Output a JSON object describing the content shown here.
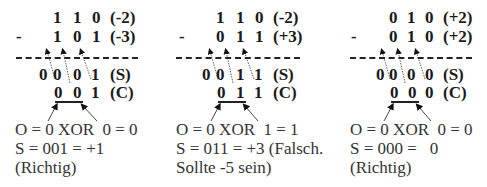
{
  "panels": [
    {
      "row1": {
        "digits": [
          "1",
          "1",
          "0"
        ],
        "label": "(-2)"
      },
      "row2": {
        "sign": "-",
        "digits": [
          "1",
          "0",
          "1"
        ],
        "label": "(-3)"
      },
      "sum": {
        "digits": [
          "0",
          "0",
          "0",
          "1"
        ],
        "label": "(S)"
      },
      "carry": {
        "digits": [
          "0",
          "0",
          "1"
        ],
        "label": "(C)"
      },
      "overflow_line": "O = 0 XOR  0 = 0",
      "result_line": "S = 001 = +1",
      "verdict_line": "(Richtig)"
    },
    {
      "row1": {
        "digits": [
          "1",
          "1",
          "0"
        ],
        "label": "(-2)"
      },
      "row2": {
        "sign": "-",
        "digits": [
          "0",
          "1",
          "1"
        ],
        "label": "(+3)"
      },
      "sum": {
        "digits": [
          "0",
          "0",
          "1",
          "1"
        ],
        "label": "(S)"
      },
      "carry": {
        "digits": [
          "0",
          "1",
          "1"
        ],
        "label": "(C)"
      },
      "overflow_line": "O = 0 XOR  1 = 1",
      "result_line": "S = 011 = +3 (Falsch.",
      "verdict_line": "Sollte -5 sein)"
    },
    {
      "row1": {
        "digits": [
          "0",
          "1",
          "0"
        ],
        "label": "(+2)"
      },
      "row2": {
        "sign": "-",
        "digits": [
          "0",
          "1",
          "0"
        ],
        "label": "(+2)"
      },
      "sum": {
        "digits": [
          "0",
          "0",
          "0",
          "0"
        ],
        "label": "(S)"
      },
      "carry": {
        "digits": [
          "0",
          "0",
          "0"
        ],
        "label": "(C)"
      },
      "overflow_line": "O = 0 XOR  0 = 0",
      "result_line": "S = 000 =   0",
      "verdict_line": "(Richtig)"
    }
  ]
}
